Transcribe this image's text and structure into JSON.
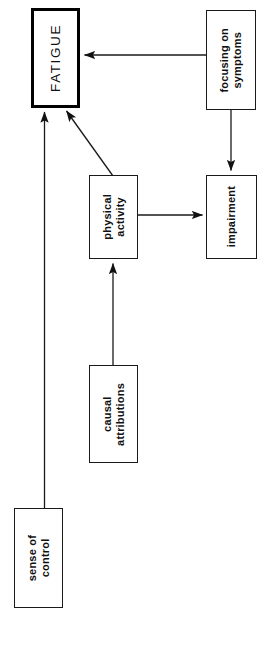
{
  "diagram": {
    "type": "flow-diagram",
    "orientation": "rotated-90-labels",
    "background_color": "#ffffff",
    "line_color": "#1a1a1a",
    "nodes": [
      {
        "id": "fatigue",
        "label": "FATIGUE",
        "emphasis": true,
        "x": 31,
        "y": 8,
        "w": 49,
        "h": 100
      },
      {
        "id": "focusing",
        "label": "focusing on\nsymptoms",
        "emphasis": false,
        "x": 206,
        "y": 10,
        "w": 50,
        "h": 100
      },
      {
        "id": "physical",
        "label": "physical\nactivity",
        "emphasis": false,
        "x": 89,
        "y": 175,
        "w": 49,
        "h": 84
      },
      {
        "id": "impairment",
        "label": "impairment",
        "emphasis": false,
        "x": 206,
        "y": 175,
        "w": 51,
        "h": 84
      },
      {
        "id": "causal",
        "label": "causal\nattributions",
        "emphasis": false,
        "x": 89,
        "y": 365,
        "w": 49,
        "h": 98
      },
      {
        "id": "sense",
        "label": "sense of\ncontrol",
        "emphasis": false,
        "x": 14,
        "y": 508,
        "w": 49,
        "h": 100
      }
    ],
    "edges": [
      {
        "id": "edge-focusing-to-fatigue",
        "from": "focusing",
        "to": "fatigue",
        "style": "straight-horizontal",
        "arrowhead": true
      },
      {
        "id": "edge-focusing-to-impairment",
        "from": "focusing",
        "to": "impairment",
        "style": "straight-vertical",
        "arrowhead": true
      },
      {
        "id": "edge-physical-to-impairment",
        "from": "physical",
        "to": "impairment",
        "style": "straight-horizontal",
        "arrowhead": true
      },
      {
        "id": "edge-physical-to-fatigue",
        "from": "physical",
        "to": "fatigue",
        "style": "diagonal",
        "arrowhead": true
      },
      {
        "id": "edge-causal-to-physical",
        "from": "causal",
        "to": "physical",
        "style": "straight-vertical",
        "arrowhead": true
      },
      {
        "id": "edge-sense-to-fatigue",
        "from": "sense",
        "to": "fatigue",
        "style": "straight-vertical",
        "arrowhead": true
      }
    ]
  }
}
